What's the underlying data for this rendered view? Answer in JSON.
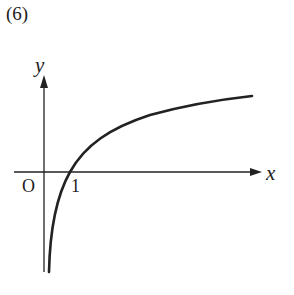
{
  "problem_number": "(6)",
  "axes": {
    "x_label": "x",
    "y_label": "y",
    "origin_label": "O",
    "tick_label": "1"
  },
  "curve": {
    "description": "y = log x (logarithmic curve, increasing, crossing x-axis at 1, asymptotic to y-axis)"
  },
  "colors": {
    "ink": "#222222",
    "background": "#ffffff"
  }
}
